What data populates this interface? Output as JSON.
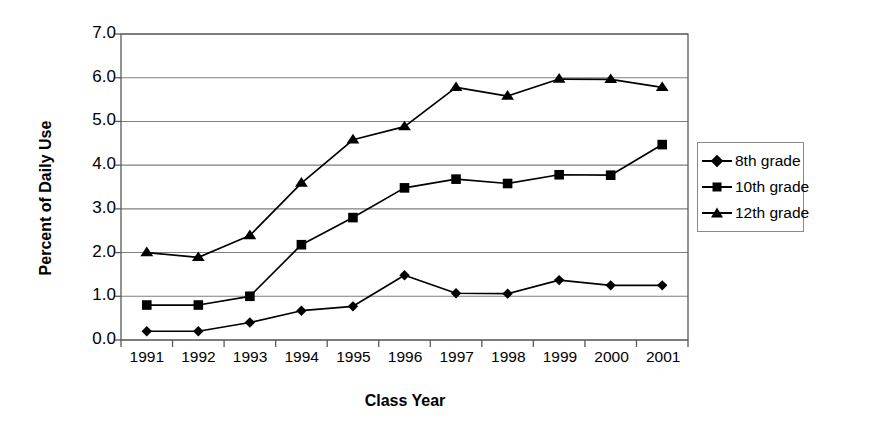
{
  "chart_data": {
    "type": "line",
    "title": "",
    "xlabel": "Class Year",
    "ylabel": "Percent of Daily Use",
    "categories": [
      "1991",
      "1992",
      "1993",
      "1994",
      "1995",
      "1996",
      "1997",
      "1998",
      "1999",
      "2000",
      "2001"
    ],
    "ylim": [
      0.0,
      7.0
    ],
    "ytick_labels": [
      "7.0",
      "6.0",
      "5.0",
      "4.0",
      "3.0",
      "2.0",
      "1.0",
      "0.0"
    ],
    "ytick_values": [
      7.0,
      6.0,
      5.0,
      4.0,
      3.0,
      2.0,
      1.0,
      0.0
    ],
    "grid": true,
    "grid_axis": "y",
    "legend_position": "right",
    "series": [
      {
        "name": "8th grade",
        "marker": "diamond",
        "values": [
          0.2,
          0.2,
          0.4,
          0.67,
          0.77,
          1.48,
          1.07,
          1.06,
          1.37,
          1.25,
          1.25
        ]
      },
      {
        "name": "10th grade",
        "marker": "square",
        "values": [
          0.8,
          0.8,
          1.0,
          2.18,
          2.8,
          3.48,
          3.68,
          3.58,
          3.78,
          3.77,
          4.47
        ]
      },
      {
        "name": "12th grade",
        "marker": "triangle",
        "values": [
          2.0,
          1.89,
          2.39,
          3.59,
          4.58,
          4.88,
          5.78,
          5.58,
          5.97,
          5.96,
          5.78
        ]
      }
    ],
    "colors": {
      "series_line": "#000000",
      "marker": "#000000",
      "grid": "#7f7f7f",
      "axis": "#595959",
      "background": "#ffffff"
    }
  }
}
